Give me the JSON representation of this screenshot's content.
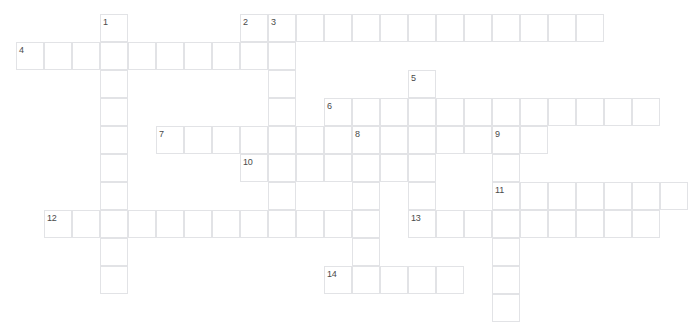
{
  "puzzle": {
    "title": "Crossword Grid",
    "cell_size": 28,
    "origin_x": 16,
    "origin_y": 14,
    "cols": 24,
    "rows": 11,
    "colors": {
      "background": "#ffffff",
      "cell_fill": "#ffffff",
      "cell_border": "#e2e3e6",
      "number_text": "#4a4a4a"
    },
    "entries": [
      {
        "number": "1",
        "direction": "down",
        "col": 3,
        "row": 0,
        "length": 10
      },
      {
        "number": "2",
        "direction": "down",
        "col": 8,
        "row": 0,
        "length": 2
      },
      {
        "number": "3",
        "direction": "down",
        "col": 9,
        "row": 0,
        "length": 7
      },
      {
        "number": "2",
        "direction": "across",
        "col": 8,
        "row": 0,
        "length": 13
      },
      {
        "number": "4",
        "direction": "across",
        "col": 0,
        "row": 1,
        "length": 9
      },
      {
        "number": "5",
        "direction": "down",
        "col": 14,
        "row": 2,
        "length": 5
      },
      {
        "number": "6",
        "direction": "across",
        "col": 11,
        "row": 3,
        "length": 12
      },
      {
        "number": "7",
        "direction": "across",
        "col": 5,
        "row": 4,
        "length": 8
      },
      {
        "number": "8",
        "direction": "across",
        "col": 12,
        "row": 4,
        "length": 7
      },
      {
        "number": "8",
        "direction": "down",
        "col": 12,
        "row": 4,
        "length": 6
      },
      {
        "number": "9",
        "direction": "down",
        "col": 17,
        "row": 4,
        "length": 7
      },
      {
        "number": "10",
        "direction": "across",
        "col": 8,
        "row": 5,
        "length": 6
      },
      {
        "number": "11",
        "direction": "across",
        "col": 17,
        "row": 6,
        "length": 7
      },
      {
        "number": "12",
        "direction": "across",
        "col": 1,
        "row": 7,
        "length": 11
      },
      {
        "number": "13",
        "direction": "across",
        "col": 14,
        "row": 7,
        "length": 9
      },
      {
        "number": "14",
        "direction": "across",
        "col": 11,
        "row": 9,
        "length": 5
      }
    ],
    "numbers": [
      {
        "label": "1",
        "col": 3,
        "row": 0
      },
      {
        "label": "2",
        "col": 8,
        "row": 0
      },
      {
        "label": "3",
        "col": 9,
        "row": 0
      },
      {
        "label": "4",
        "col": 0,
        "row": 1
      },
      {
        "label": "5",
        "col": 14,
        "row": 2
      },
      {
        "label": "6",
        "col": 11,
        "row": 3
      },
      {
        "label": "7",
        "col": 5,
        "row": 4
      },
      {
        "label": "8",
        "col": 12,
        "row": 4
      },
      {
        "label": "9",
        "col": 17,
        "row": 4
      },
      {
        "label": "10",
        "col": 8,
        "row": 5
      },
      {
        "label": "11",
        "col": 17,
        "row": 6
      },
      {
        "label": "12",
        "col": 1,
        "row": 7
      },
      {
        "label": "13",
        "col": 14,
        "row": 7
      },
      {
        "label": "14",
        "col": 11,
        "row": 9
      }
    ]
  }
}
